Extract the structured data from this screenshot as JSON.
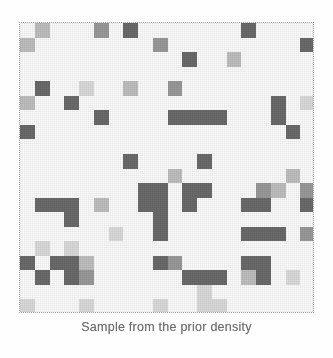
{
  "figure": {
    "caption": "Sample from the prior density",
    "background_color": "#fefefe",
    "frame_color": "#9a9a9a",
    "frame": {
      "x": 19,
      "y": 22,
      "width": 295,
      "height": 291
    }
  },
  "chart_data": {
    "type": "heatmap",
    "title": "Sample from the prior density",
    "xlabel": "",
    "ylabel": "",
    "grid": false,
    "legend": "none",
    "rows": 20,
    "cols": 20,
    "value_range": [
      0,
      4
    ],
    "level_colors": [
      "#fdfdfd",
      "#dcdcdc",
      "#c0c0c0",
      "#9a9a9a",
      "#6b6b6b"
    ],
    "level_labels": [
      "white",
      "very-light-gray",
      "light-gray",
      "medium-gray",
      "dark-gray"
    ],
    "values": [
      [
        0,
        2,
        0,
        0,
        0,
        3,
        0,
        4,
        0,
        0,
        0,
        0,
        0,
        0,
        0,
        4,
        0,
        0,
        0,
        0
      ],
      [
        2,
        0,
        0,
        0,
        0,
        0,
        0,
        0,
        0,
        3,
        0,
        0,
        0,
        0,
        0,
        0,
        0,
        0,
        0,
        4
      ],
      [
        0,
        0,
        0,
        0,
        0,
        0,
        0,
        0,
        0,
        0,
        0,
        4,
        0,
        0,
        2,
        0,
        0,
        0,
        0,
        0
      ],
      [
        0,
        0,
        0,
        0,
        0,
        0,
        0,
        0,
        0,
        0,
        0,
        0,
        0,
        0,
        0,
        0,
        0,
        0,
        0,
        0
      ],
      [
        0,
        4,
        0,
        0,
        1,
        0,
        0,
        2,
        0,
        0,
        3,
        0,
        0,
        0,
        0,
        0,
        0,
        0,
        0,
        0
      ],
      [
        2,
        0,
        0,
        4,
        0,
        0,
        0,
        0,
        0,
        0,
        0,
        0,
        0,
        0,
        0,
        0,
        0,
        4,
        0,
        1
      ],
      [
        0,
        0,
        0,
        0,
        0,
        4,
        0,
        0,
        0,
        0,
        4,
        4,
        4,
        4,
        0,
        0,
        0,
        4,
        0,
        0
      ],
      [
        4,
        0,
        0,
        0,
        0,
        0,
        0,
        0,
        0,
        0,
        0,
        0,
        0,
        0,
        0,
        0,
        0,
        0,
        4,
        0
      ],
      [
        0,
        0,
        0,
        0,
        0,
        0,
        0,
        0,
        0,
        0,
        0,
        0,
        0,
        0,
        0,
        0,
        0,
        0,
        0,
        0
      ],
      [
        0,
        0,
        0,
        0,
        0,
        0,
        0,
        4,
        0,
        0,
        0,
        0,
        4,
        0,
        0,
        0,
        0,
        0,
        0,
        0
      ],
      [
        0,
        0,
        0,
        0,
        0,
        0,
        0,
        0,
        0,
        0,
        2,
        0,
        0,
        0,
        0,
        0,
        0,
        0,
        2,
        0
      ],
      [
        0,
        0,
        0,
        0,
        0,
        0,
        0,
        0,
        4,
        4,
        0,
        4,
        4,
        0,
        0,
        0,
        3,
        2,
        0,
        3
      ],
      [
        0,
        4,
        4,
        4,
        0,
        2,
        0,
        0,
        4,
        4,
        0,
        4,
        0,
        0,
        0,
        4,
        4,
        0,
        0,
        4
      ],
      [
        0,
        0,
        0,
        4,
        0,
        0,
        0,
        0,
        0,
        4,
        0,
        0,
        0,
        0,
        0,
        0,
        0,
        0,
        0,
        0
      ],
      [
        0,
        0,
        0,
        0,
        0,
        0,
        1,
        0,
        0,
        4,
        0,
        0,
        0,
        0,
        0,
        4,
        4,
        4,
        0,
        3
      ],
      [
        0,
        1,
        0,
        1,
        0,
        0,
        0,
        0,
        0,
        0,
        0,
        0,
        0,
        0,
        0,
        0,
        0,
        0,
        0,
        0
      ],
      [
        4,
        0,
        4,
        4,
        2,
        0,
        0,
        0,
        0,
        4,
        3,
        0,
        0,
        0,
        0,
        4,
        4,
        0,
        0,
        0
      ],
      [
        0,
        4,
        0,
        4,
        3,
        0,
        0,
        0,
        0,
        0,
        0,
        4,
        4,
        4,
        0,
        2,
        4,
        0,
        1,
        0
      ],
      [
        0,
        0,
        0,
        0,
        0,
        0,
        0,
        0,
        0,
        0,
        0,
        0,
        1,
        0,
        0,
        0,
        0,
        0,
        0,
        0
      ],
      [
        1,
        0,
        0,
        0,
        1,
        0,
        0,
        0,
        0,
        1,
        0,
        0,
        1,
        1,
        0,
        0,
        0,
        0,
        0,
        0
      ]
    ]
  }
}
